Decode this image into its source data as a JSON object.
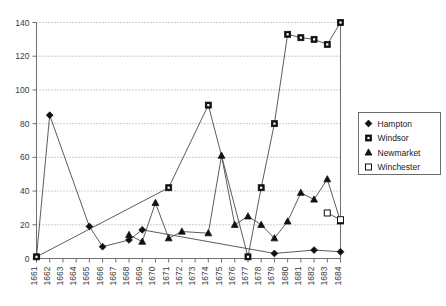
{
  "chart_data": {
    "type": "line",
    "title": "",
    "subtitle": "",
    "xlabel": "",
    "ylabel": "",
    "xlim": [
      1661,
      1684
    ],
    "ylim": [
      0,
      140
    ],
    "ytick_step": 20,
    "grid": true,
    "legend_position": "right",
    "x": [
      1661,
      1662,
      1663,
      1664,
      1665,
      1666,
      1667,
      1668,
      1669,
      1670,
      1671,
      1672,
      1673,
      1674,
      1675,
      1676,
      1677,
      1678,
      1679,
      1680,
      1681,
      1682,
      1683,
      1684
    ],
    "xticks": [
      "1661",
      "1662",
      "1663",
      "1664",
      "1665",
      "1666",
      "1667",
      "1668",
      "1669",
      "1670",
      "1671",
      "1672",
      "1673",
      "1674",
      "1675",
      "1676",
      "1677",
      "1678",
      "1679",
      "1680",
      "1681",
      "1682",
      "1683",
      "1684"
    ],
    "yticks": [
      "0",
      "20",
      "40",
      "60",
      "80",
      "100",
      "120",
      "140"
    ],
    "series": [
      {
        "name": "Hampton",
        "marker": "filled-diamond",
        "color": "#111111",
        "points": [
          {
            "x": 1661,
            "y": 1
          },
          {
            "x": 1662,
            "y": 85
          },
          {
            "x": 1665,
            "y": 19
          },
          {
            "x": 1666,
            "y": 7
          },
          {
            "x": 1668,
            "y": 11
          },
          {
            "x": 1669,
            "y": 17
          },
          {
            "x": 1679,
            "y": 3
          },
          {
            "x": 1682,
            "y": 5
          },
          {
            "x": 1684,
            "y": 4
          }
        ]
      },
      {
        "name": "Windsor",
        "marker": "filled-square",
        "color": "#111111",
        "points": [
          {
            "x": 1661,
            "y": 1
          },
          {
            "x": 1671,
            "y": 42
          },
          {
            "x": 1674,
            "y": 91
          },
          {
            "x": 1677,
            "y": 1
          },
          {
            "x": 1678,
            "y": 42
          },
          {
            "x": 1679,
            "y": 80
          },
          {
            "x": 1680,
            "y": 133
          },
          {
            "x": 1681,
            "y": 131
          },
          {
            "x": 1682,
            "y": 130
          },
          {
            "x": 1683,
            "y": 127
          },
          {
            "x": 1684,
            "y": 140
          }
        ]
      },
      {
        "name": "Newmarket",
        "marker": "filled-triangle",
        "color": "#111111",
        "points": [
          {
            "x": 1668,
            "y": 14
          },
          {
            "x": 1669,
            "y": 10
          },
          {
            "x": 1670,
            "y": 33
          },
          {
            "x": 1671,
            "y": 12
          },
          {
            "x": 1672,
            "y": 16
          },
          {
            "x": 1674,
            "y": 15
          },
          {
            "x": 1675,
            "y": 61
          },
          {
            "x": 1676,
            "y": 20
          },
          {
            "x": 1677,
            "y": 25
          },
          {
            "x": 1678,
            "y": 20
          },
          {
            "x": 1679,
            "y": 12
          },
          {
            "x": 1680,
            "y": 22
          },
          {
            "x": 1681,
            "y": 39
          },
          {
            "x": 1682,
            "y": 35
          },
          {
            "x": 1683,
            "y": 47
          },
          {
            "x": 1684,
            "y": 22
          }
        ]
      },
      {
        "name": "Winchester",
        "marker": "open-square",
        "color": "#111111",
        "points": [
          {
            "x": 1683,
            "y": 27
          },
          {
            "x": 1684,
            "y": 23
          }
        ]
      }
    ],
    "legend": [
      {
        "label": "Hampton",
        "marker": "filled-diamond"
      },
      {
        "label": "Windsor",
        "marker": "filled-square"
      },
      {
        "label": "Newmarket",
        "marker": "filled-triangle"
      },
      {
        "label": "Winchester",
        "marker": "open-square"
      }
    ]
  }
}
